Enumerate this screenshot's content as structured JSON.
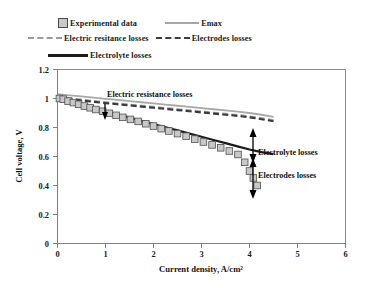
{
  "legend": {
    "rows": [
      [
        {
          "key": "marker-square",
          "label": "Experimental data"
        },
        {
          "key": "solid-grey",
          "label": "Emax"
        }
      ],
      [
        {
          "key": "dash-grey",
          "label": "Electric resitance losses"
        },
        {
          "key": "dash-dark",
          "label": "Electrodes losses"
        }
      ],
      [
        {
          "key": "solid-black",
          "label": "Electrolyte losses"
        }
      ]
    ]
  },
  "annotations": [
    {
      "name": "electric-resistance-losses",
      "text": "Electric resistance losses"
    },
    {
      "name": "electrolyte-losses",
      "text": "Electrolyte losses"
    },
    {
      "name": "electrodes-losses",
      "text": "Electrodes losses"
    }
  ],
  "chart_data": {
    "type": "line",
    "title": "",
    "xlabel": "Current density, A/cm²",
    "ylabel": "Cell voltage, V",
    "xlim": [
      0,
      6
    ],
    "ylim": [
      0,
      1.2
    ],
    "xticks": [
      0,
      1,
      2,
      3,
      4,
      5,
      6
    ],
    "yticks": [
      0,
      0.2,
      0.4,
      0.6,
      0.8,
      1,
      1.2
    ],
    "xticklabels": [
      "0",
      "1",
      "2",
      "3",
      "4",
      "5",
      "6"
    ],
    "yticklabels": [
      "0",
      "0.2",
      "0.4",
      "0.6",
      "0.8",
      "1",
      "1.2"
    ],
    "grid": false,
    "legend_position": "above-plot",
    "series": [
      {
        "name": "Emax",
        "style": "solid",
        "color": "#a8a8a8",
        "x": [
          0.0,
          0.25,
          0.5,
          0.75,
          1.0,
          1.25,
          1.5,
          1.75,
          2.0,
          2.25,
          2.5,
          2.75,
          3.0,
          3.25,
          3.5,
          3.75,
          4.0,
          4.25,
          4.5
        ],
        "y": [
          1.03,
          1.022,
          1.014,
          1.006,
          0.998,
          0.99,
          0.982,
          0.974,
          0.966,
          0.958,
          0.95,
          0.942,
          0.934,
          0.926,
          0.918,
          0.91,
          0.9,
          0.888,
          0.874
        ]
      },
      {
        "name": "Electric resitance losses",
        "style": "dashed",
        "color": "#9d9d9d",
        "x": [
          0.0,
          0.25,
          0.5,
          0.75,
          1.0,
          1.25,
          1.5,
          1.75,
          2.0,
          2.25,
          2.5,
          2.75,
          3.0,
          3.25,
          3.5,
          3.75,
          4.0,
          4.25,
          4.5
        ],
        "y": [
          1.012,
          1.002,
          0.992,
          0.983,
          0.974,
          0.966,
          0.958,
          0.95,
          0.942,
          0.934,
          0.926,
          0.918,
          0.91,
          0.902,
          0.894,
          0.886,
          0.876,
          0.864,
          0.85
        ]
      },
      {
        "name": "Electrodes losses",
        "style": "dashed",
        "color": "#3c3c3c",
        "x": [
          0.0,
          0.25,
          0.5,
          0.75,
          1.0,
          1.25,
          1.5,
          1.75,
          2.0,
          2.25,
          2.5,
          2.75,
          3.0,
          3.25,
          3.5,
          3.75,
          4.0,
          4.25,
          4.5
        ],
        "y": [
          1.006,
          0.996,
          0.986,
          0.977,
          0.968,
          0.96,
          0.952,
          0.944,
          0.936,
          0.928,
          0.92,
          0.912,
          0.904,
          0.896,
          0.888,
          0.88,
          0.87,
          0.857,
          0.843
        ]
      },
      {
        "name": "Electrolyte losses",
        "style": "solid",
        "color": "#1c1c1c",
        "x": [
          0.0,
          0.25,
          0.5,
          0.75,
          1.0,
          1.25,
          1.5,
          1.75,
          2.0,
          2.25,
          2.5,
          2.75,
          3.0,
          3.25,
          3.5,
          3.75,
          4.0,
          4.25,
          4.5
        ],
        "y": [
          1.0,
          0.978,
          0.956,
          0.934,
          0.912,
          0.89,
          0.868,
          0.846,
          0.824,
          0.802,
          0.78,
          0.758,
          0.736,
          0.714,
          0.692,
          0.67,
          0.648,
          0.63,
          0.616
        ]
      },
      {
        "name": "Experimental data",
        "style": "markers",
        "color": "#c8c8c8",
        "x": [
          0.04,
          0.12,
          0.22,
          0.33,
          0.44,
          0.56,
          0.68,
          0.8,
          0.94,
          1.08,
          1.22,
          1.36,
          1.52,
          1.68,
          1.84,
          2.0,
          2.16,
          2.32,
          2.5,
          2.68,
          2.86,
          3.04,
          3.22,
          3.4,
          3.58,
          3.76,
          3.9,
          4.0,
          4.08,
          4.16
        ],
        "y": [
          1.0,
          0.995,
          0.982,
          0.972,
          0.96,
          0.948,
          0.936,
          0.924,
          0.912,
          0.898,
          0.884,
          0.87,
          0.856,
          0.842,
          0.826,
          0.81,
          0.792,
          0.776,
          0.758,
          0.74,
          0.72,
          0.7,
          0.68,
          0.66,
          0.638,
          0.614,
          0.56,
          0.5,
          0.452,
          0.4
        ]
      }
    ]
  }
}
